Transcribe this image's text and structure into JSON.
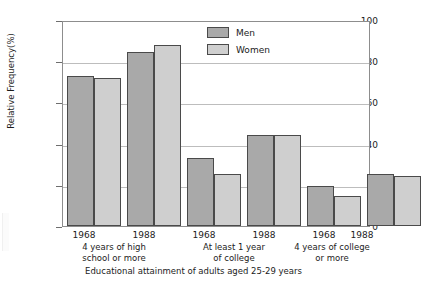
{
  "chart_data": {
    "type": "bar",
    "title": "",
    "xlabel": "Educational attainment of adults aged 25-29 years",
    "ylabel": "Relative Frequency(%)",
    "ylim": [
      0,
      100
    ],
    "yticks": [
      0,
      20,
      40,
      60,
      80,
      100
    ],
    "grid": true,
    "legend_position": "top-center",
    "categories": [
      "1968",
      "1988",
      "1968",
      "1988",
      "1968",
      "1988"
    ],
    "group_labels": [
      "4 years of high school or more",
      "At least 1 year of college",
      "4 years of college or more"
    ],
    "series": [
      {
        "name": "Men",
        "color": "#a9a9a9",
        "values": [
          73.5,
          85.5,
          33.5,
          44.8,
          19.5,
          25.5
        ]
      },
      {
        "name": "Women",
        "color": "#cfcfcf",
        "values": [
          72.5,
          88.5,
          25.5,
          44.5,
          14.5,
          24.5
        ]
      }
    ]
  },
  "axes": {
    "y_label": "Relative Frequency(%)",
    "y_ticks": [
      "0",
      "20",
      "40",
      "60",
      "80",
      "100"
    ],
    "x_title": "Educational attainment of adults aged 25-29 years",
    "x_years": [
      "1968",
      "1988",
      "1968",
      "1988",
      "1968",
      "1988"
    ],
    "x_groups": [
      {
        "line1": "4 years of high",
        "line2": "school or more"
      },
      {
        "line1": "At least 1 year",
        "line2": "of college"
      },
      {
        "line1": "4 years of college",
        "line2": "or more"
      }
    ]
  },
  "legend": {
    "items": [
      {
        "label": "Men",
        "color": "#a9a9a9"
      },
      {
        "label": "Women",
        "color": "#cfcfcf"
      }
    ]
  }
}
